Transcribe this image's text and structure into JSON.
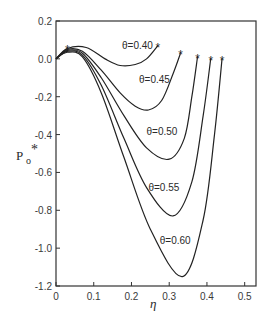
{
  "chart_data": {
    "type": "line",
    "title": "",
    "xlabel": "η",
    "ylabel": "P0*",
    "xlim": [
      0,
      0.53
    ],
    "ylim": [
      -1.2,
      0.2
    ],
    "xticks": [
      "0",
      "0.1",
      "0.2",
      "0.3",
      "0.4",
      "0.5"
    ],
    "yticks": [
      "0.2",
      "0.0",
      "-0.2",
      "-0.4",
      "-0.6",
      "-0.8",
      "-1.0",
      "-1.2"
    ],
    "grid": false,
    "legend": "inline labels on curves",
    "series": [
      {
        "name": "θ=0.40",
        "label": "θ=0.40",
        "x": [
          0,
          0.03,
          0.08,
          0.13,
          0.17,
          0.21,
          0.24,
          0.27
        ],
        "y": [
          0,
          0.055,
          0.06,
          0.0,
          -0.035,
          -0.03,
          0.0,
          0.07
        ]
      },
      {
        "name": "θ=0.45",
        "label": "θ=0.45",
        "x": [
          0,
          0.03,
          0.07,
          0.12,
          0.17,
          0.21,
          0.245,
          0.28,
          0.31,
          0.33
        ],
        "y": [
          0,
          0.05,
          0.04,
          -0.06,
          -0.18,
          -0.25,
          -0.27,
          -0.22,
          -0.08,
          0.03
        ]
      },
      {
        "name": "θ=0.50",
        "label": "θ=0.50",
        "x": [
          0,
          0.03,
          0.07,
          0.12,
          0.18,
          0.24,
          0.3,
          0.34,
          0.36,
          0.375
        ],
        "y": [
          0,
          0.045,
          0.03,
          -0.1,
          -0.3,
          -0.47,
          -0.53,
          -0.42,
          -0.2,
          0.01
        ]
      },
      {
        "name": "θ=0.55",
        "label": "θ=0.55",
        "x": [
          0,
          0.03,
          0.07,
          0.12,
          0.18,
          0.24,
          0.31,
          0.36,
          0.39,
          0.41
        ],
        "y": [
          0,
          0.04,
          0.02,
          -0.14,
          -0.42,
          -0.68,
          -0.83,
          -0.65,
          -0.3,
          0.0
        ]
      },
      {
        "name": "θ=0.60",
        "label": "θ=0.60",
        "x": [
          0,
          0.03,
          0.07,
          0.12,
          0.18,
          0.25,
          0.335,
          0.39,
          0.42,
          0.44
        ],
        "y": [
          0,
          0.035,
          0.01,
          -0.18,
          -0.52,
          -0.9,
          -1.15,
          -0.85,
          -0.4,
          0.0
        ]
      }
    ],
    "annotations": [
      "* marks curve endpoints"
    ]
  }
}
